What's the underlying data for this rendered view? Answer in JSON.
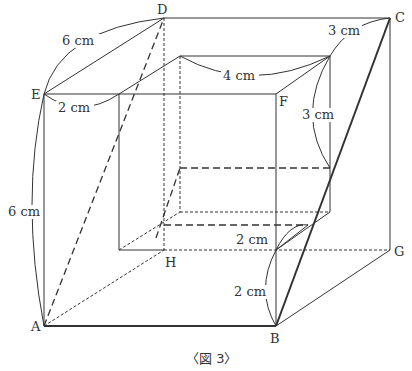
{
  "figure": {
    "caption": "〈図 3〉",
    "vertices": {
      "A": "A",
      "B": "B",
      "C": "C",
      "D": "D",
      "E": "E",
      "F": "F",
      "G": "G",
      "H": "H"
    },
    "measurements": {
      "ED": "6 cm",
      "EA": "6 cm",
      "E_inner": "2 cm",
      "top_inner": "4 cm",
      "C_top": "3 cm",
      "C_side": "3 cm",
      "B_upper": "2 cm",
      "B_lower": "2 cm"
    },
    "colors": {
      "line": "#333333",
      "background": "#ffffff"
    }
  }
}
